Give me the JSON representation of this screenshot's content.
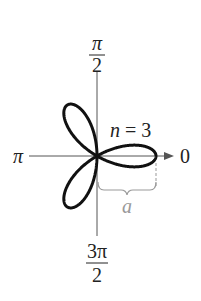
{
  "diagram": {
    "type": "polar-rose-curve",
    "equation_label": {
      "var": "n",
      "eq": " = 3"
    },
    "angle_labels": {
      "top": {
        "num": "π",
        "den": "2"
      },
      "left": "π",
      "right": "0",
      "bottom": {
        "num": "3π",
        "den": "2"
      }
    },
    "length_label": "a",
    "petals": 3,
    "colors": {
      "curve": "#111111",
      "axis": "#555555",
      "brace": "#999999",
      "label": "#222222"
    }
  }
}
